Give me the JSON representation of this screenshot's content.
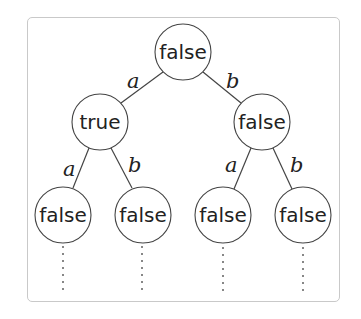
{
  "diagram": {
    "type": "binary-tree",
    "nodes": {
      "root": {
        "label": "false",
        "cx": 183,
        "cy": 52
      },
      "left": {
        "label": "true",
        "cx": 100,
        "cy": 122
      },
      "right": {
        "label": "false",
        "cx": 262,
        "cy": 122
      },
      "left_left": {
        "label": "false",
        "cx": 63,
        "cy": 215
      },
      "left_right": {
        "label": "false",
        "cx": 143,
        "cy": 215
      },
      "right_left": {
        "label": "false",
        "cx": 223,
        "cy": 215
      },
      "right_right": {
        "label": "false",
        "cx": 303,
        "cy": 215
      }
    },
    "edges": {
      "root_left": {
        "label": "a"
      },
      "root_right": {
        "label": "b"
      },
      "left_left": {
        "label": "a"
      },
      "left_right": {
        "label": "b"
      },
      "right_left": {
        "label": "a"
      },
      "right_right": {
        "label": "b"
      }
    },
    "node_radius": 28,
    "colors": {
      "stroke": "#444444",
      "frame": "#c9c9c9",
      "text": "#222222",
      "background": "#ffffff"
    }
  }
}
